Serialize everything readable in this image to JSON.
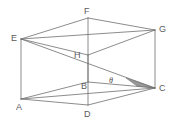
{
  "figure": {
    "kind": "cuboid-wireframe",
    "canvas": {
      "width": 175,
      "height": 135,
      "background": "#ffffff"
    },
    "colors": {
      "stroke": "#6e6e6e",
      "stroke_light": "#9a9a9a",
      "label": "#5a5a5a",
      "shade_fill": "#8c8c8c",
      "background": "#ffffff"
    },
    "stroke_width": 0.8,
    "vertices": [
      {
        "id": "A",
        "label": "A",
        "x": 21,
        "y": 99,
        "label_x": 16,
        "label_y": 103,
        "hidden": false
      },
      {
        "id": "B",
        "label": "B",
        "x": 88,
        "y": 82,
        "label_x": 81,
        "label_y": 82,
        "hidden": true
      },
      {
        "id": "C",
        "label": "C",
        "x": 155,
        "y": 88,
        "label_x": 159,
        "label_y": 84,
        "hidden": false
      },
      {
        "id": "D",
        "label": "D",
        "x": 88,
        "y": 105,
        "label_x": 84,
        "label_y": 110,
        "hidden": false
      },
      {
        "id": "E",
        "label": "E",
        "x": 21,
        "y": 39,
        "label_x": 11,
        "label_y": 34,
        "hidden": false
      },
      {
        "id": "F",
        "label": "F",
        "x": 88,
        "y": 18,
        "label_x": 84,
        "label_y": 7,
        "hidden": false
      },
      {
        "id": "G",
        "label": "G",
        "x": 155,
        "y": 30,
        "label_x": 159,
        "label_y": 25,
        "hidden": false
      },
      {
        "id": "H",
        "label": "H",
        "x": 88,
        "y": 55,
        "label_x": 74,
        "label_y": 51,
        "hidden": true
      }
    ],
    "edges": [
      {
        "from": "A",
        "to": "D",
        "style": "solid"
      },
      {
        "from": "D",
        "to": "C",
        "style": "solid"
      },
      {
        "from": "A",
        "to": "B",
        "style": "solid"
      },
      {
        "from": "B",
        "to": "C",
        "style": "solid"
      },
      {
        "from": "E",
        "to": "F",
        "style": "solid"
      },
      {
        "from": "F",
        "to": "G",
        "style": "solid"
      },
      {
        "from": "E",
        "to": "H",
        "style": "solid"
      },
      {
        "from": "H",
        "to": "G",
        "style": "solid"
      },
      {
        "from": "A",
        "to": "E",
        "style": "solid"
      },
      {
        "from": "D",
        "to": "H",
        "style": "solid"
      },
      {
        "from": "C",
        "to": "G",
        "style": "solid"
      },
      {
        "from": "B",
        "to": "F",
        "style": "solid"
      }
    ],
    "diagonals": [
      {
        "from": "E",
        "to": "C",
        "style": "solid"
      },
      {
        "from": "A",
        "to": "C",
        "style": "solid"
      },
      {
        "from": "E",
        "to": "G",
        "style": "solid"
      }
    ],
    "shaded_region": {
      "name": "angle-triangle-shade",
      "points": "126,78 155,88 137,86",
      "fill": "#8c8c8c",
      "opacity": 0.85
    },
    "angle_marker": {
      "symbol": "θ",
      "label_x": 109,
      "label_y": 77,
      "arc_center_x": 155,
      "arc_center_y": 88
    }
  }
}
